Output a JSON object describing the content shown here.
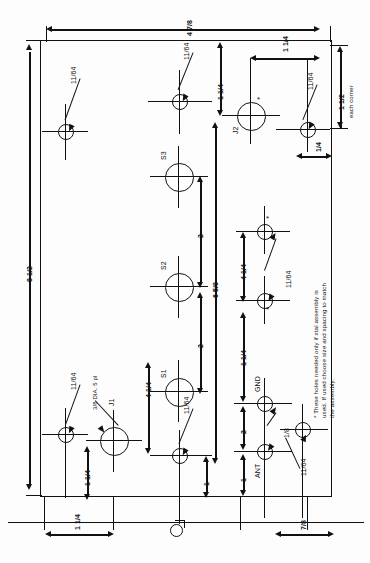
{
  "drawing": {
    "title": "Front panel drilling layout",
    "orientation": "text rotated 90 degrees (sideways sheet)",
    "units": "inches",
    "overall": {
      "width_label": "4 7/8",
      "height_label": "8 1/2"
    },
    "corner_note": {
      "radius_label": "1 1/2",
      "qualifier": "each corner"
    },
    "footnote": "* These holes needed only if xtal assembly is\nused. If used choose size and spacing to match\nthe assembly.",
    "hole_sizes": {
      "small": "11/64",
      "large": "3/8 DIA. 5 pl",
      "mid": "1/8"
    },
    "components": [
      {
        "id": "S1",
        "label": "S1"
      },
      {
        "id": "S2",
        "label": "S2"
      },
      {
        "id": "S3",
        "label": "S3"
      },
      {
        "id": "J1",
        "label": "J1"
      },
      {
        "id": "J2",
        "label": "J2"
      },
      {
        "id": "GND",
        "label": "GND"
      },
      {
        "id": "ANT",
        "label": "ANT"
      }
    ],
    "dimensions": [
      {
        "name": "overall-width",
        "value": "4 7/8"
      },
      {
        "name": "overall-height",
        "value": "8 1/2"
      },
      {
        "name": "corner-radius",
        "value": "1 1/2"
      },
      {
        "name": "j2-from-top",
        "value": "1 1/4"
      },
      {
        "name": "j2-to-right-hole",
        "value": "1 1/4"
      },
      {
        "name": "right-edge-offset",
        "value": "1/4"
      },
      {
        "name": "switch-spacing-upper",
        "value": "2"
      },
      {
        "name": "switch-spacing-lower",
        "value": "2"
      },
      {
        "name": "column-total",
        "value": "6 5/8"
      },
      {
        "name": "s1-from-left",
        "value": "4 1/4"
      },
      {
        "name": "xtal-hole-spacing",
        "value": "1 1/4"
      },
      {
        "name": "gnd-ant-chain-a",
        "value": "2"
      },
      {
        "name": "gnd-ant-chain-b",
        "value": "1"
      },
      {
        "name": "gnd-ant-chain-c",
        "value": "1"
      },
      {
        "name": "bottom-hole-gap",
        "value": "1"
      },
      {
        "name": "bottom-left-offset",
        "value": "1 1/4"
      },
      {
        "name": "bottom-left-offset-2",
        "value": "1 1/4"
      },
      {
        "name": "bottom-right-offset",
        "value": "7/8"
      }
    ],
    "callouts": {
      "c1": "11/64",
      "c2": "11/64",
      "c3": "11/64",
      "c4": "11/64",
      "c5": "11/64",
      "c6": "11/64",
      "c7": "11/64",
      "c8": "1/8",
      "c9": "3/8 DIA. 5 pl"
    },
    "asterisk": "*"
  }
}
